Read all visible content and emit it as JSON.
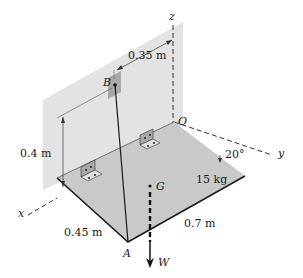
{
  "diagram": {
    "axes": {
      "x": "x",
      "y": "y",
      "z": "z",
      "origin": "O"
    },
    "points": {
      "B": "B",
      "G": "G",
      "A": "A"
    },
    "dimensions": {
      "b_to_z": "0.35 m",
      "b_height": "0.4 m",
      "plate_width": "0.45 m",
      "plate_length": "0.7 m",
      "angle": "20°"
    },
    "mass": "15 kg",
    "weight": "W",
    "colors": {
      "wall": "#e3e3e3",
      "plate": "#c9c9c9",
      "bracket": "#a8a8a8",
      "line": "#1a1a1a"
    }
  }
}
